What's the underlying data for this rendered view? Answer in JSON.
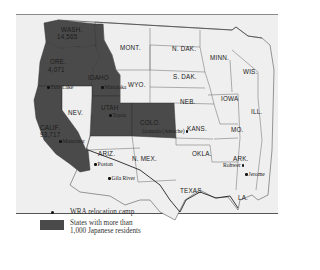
{
  "map": {
    "colors": {
      "highlight": "#4a4a4a",
      "land": "#efefef",
      "border": "#555555"
    },
    "states": [
      {
        "id": "wash",
        "label": "WASH.",
        "value": "14,565",
        "highlighted": true
      },
      {
        "id": "ore",
        "label": "ORE.",
        "value": "4,071",
        "highlighted": true
      },
      {
        "id": "idaho",
        "label": "IDAHO",
        "highlighted": true
      },
      {
        "id": "calif",
        "label": "CALIF.",
        "value": "93,717",
        "highlighted": true
      },
      {
        "id": "utah",
        "label": "UTAH",
        "highlighted": true
      },
      {
        "id": "colo",
        "label": "COLO.",
        "highlighted": true
      },
      {
        "id": "mont",
        "label": "MONT.",
        "highlighted": false
      },
      {
        "id": "wyo",
        "label": "WYO.",
        "highlighted": false
      },
      {
        "id": "nev",
        "label": "NEV.",
        "highlighted": false
      },
      {
        "id": "ariz",
        "label": "ARIZ.",
        "highlighted": false
      },
      {
        "id": "nmex",
        "label": "N. MEX.",
        "highlighted": false
      },
      {
        "id": "ndak",
        "label": "N. DAK.",
        "highlighted": false
      },
      {
        "id": "sdak",
        "label": "S. DAK.",
        "highlighted": false
      },
      {
        "id": "neb",
        "label": "NEB.",
        "highlighted": false
      },
      {
        "id": "kans",
        "label": "KANS.",
        "highlighted": false
      },
      {
        "id": "okla",
        "label": "OKLA.",
        "highlighted": false
      },
      {
        "id": "texas",
        "label": "TEXAS",
        "highlighted": false
      },
      {
        "id": "minn",
        "label": "MINN.",
        "highlighted": false
      },
      {
        "id": "iowa",
        "label": "IOWA",
        "highlighted": false
      },
      {
        "id": "mo",
        "label": "MO.",
        "highlighted": false
      },
      {
        "id": "ark",
        "label": "ARK.",
        "highlighted": false
      },
      {
        "id": "la",
        "label": "LA.",
        "highlighted": false
      },
      {
        "id": "wis",
        "label": "WIS.",
        "highlighted": false
      },
      {
        "id": "ill",
        "label": "ILL.",
        "highlighted": false
      }
    ],
    "camps": [
      {
        "name": "Tule Lake"
      },
      {
        "name": "Minidoka"
      },
      {
        "name": "Heart Mountain"
      },
      {
        "name": "Manzanar"
      },
      {
        "name": "Topaz"
      },
      {
        "name": "Granada (Amache)"
      },
      {
        "name": "Poston"
      },
      {
        "name": "Gila River"
      },
      {
        "name": "Rohwer"
      },
      {
        "name": "Jerome"
      }
    ]
  },
  "legend": {
    "camp_label": "WRA relocation camp",
    "highlight_label_line1": "States with more than",
    "highlight_label_line2": "1,000 Japanese residents"
  }
}
